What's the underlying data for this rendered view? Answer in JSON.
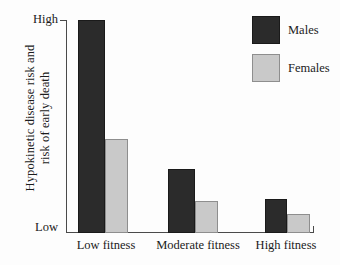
{
  "chart_data": {
    "type": "bar",
    "title": "",
    "subtitle": "",
    "xlabel": "",
    "ylabel": "Hypokinetic disease risk and risk of early death",
    "ylabel_lines": [
      "Hypokinetic disease risk and",
      "risk of early death"
    ],
    "categories": [
      "Low fitness",
      "Moderate fitness",
      "High fitness"
    ],
    "series": [
      {
        "name": "Males",
        "color": "#2b2b2b",
        "values": [
          100,
          30,
          16
        ]
      },
      {
        "name": "Females",
        "color": "#c9c9c9",
        "values": [
          44,
          15,
          9
        ]
      }
    ],
    "ytick_labels": [
      "High",
      "Low"
    ],
    "ylim_labels": {
      "max": "High",
      "min": "Low"
    },
    "ylim": [
      0,
      100
    ],
    "grid": false,
    "legend_position": "top-right",
    "legend_entries": [
      "Males",
      "Females"
    ]
  },
  "axis": {
    "y_label_line1": "Hypokinetic disease risk and",
    "y_label_line2": "risk of early death",
    "tick_high": "High",
    "tick_low": "Low"
  },
  "categories": {
    "c0": "Low fitness",
    "c1": "Moderate fitness",
    "c2": "High fitness"
  },
  "legend": {
    "males": "Males",
    "females": "Females"
  }
}
